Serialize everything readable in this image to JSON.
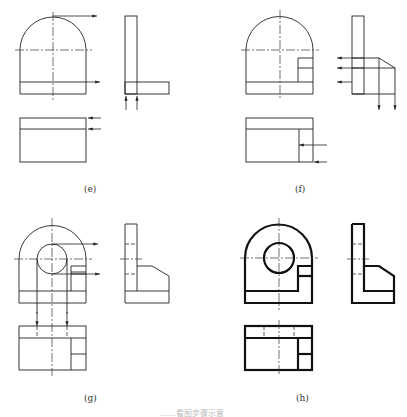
{
  "figure": {
    "panels": [
      {
        "id": "e",
        "label": "(e)"
      },
      {
        "id": "f",
        "label": "(f)"
      },
      {
        "id": "g",
        "label": "(g)"
      },
      {
        "id": "h",
        "label": "(h)"
      }
    ],
    "caption": "……看图步骤示意"
  },
  "colors": {
    "line": "#222222",
    "background": "#ffffff"
  }
}
